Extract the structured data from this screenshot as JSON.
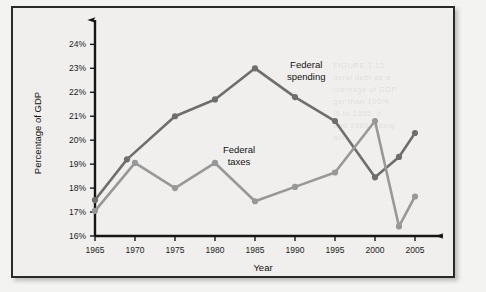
{
  "figure": {
    "background_color": "#f0efed",
    "border_color": "#2a2a2a",
    "page_color": "#f3f3f1"
  },
  "ghost": {
    "line1": "FIGURE 1.12",
    "line2": "deral debt as a",
    "line3": "rcentage of GDP",
    "line4": "ger than 100%",
    "line5": "I5 to 1955, it",
    "line6": "and 1980, rising",
    "line7": "ain."
  },
  "chart_data": {
    "type": "line",
    "title": "",
    "subtitle": "",
    "xlabel": "Year",
    "ylabel": "Percentage of GDP",
    "xlim": [
      1965,
      2007
    ],
    "ylim": [
      16,
      24.6
    ],
    "xticks": [
      1965,
      1970,
      1975,
      1980,
      1985,
      1990,
      1995,
      2000,
      2005
    ],
    "xtick_labels": [
      "1965",
      "1970",
      "1975",
      "1980",
      "1985",
      "1990",
      "1995",
      "2000",
      "2005"
    ],
    "yticks": [
      16,
      17,
      18,
      19,
      20,
      21,
      22,
      23,
      24
    ],
    "ytick_labels": [
      "16%",
      "17%",
      "18%",
      "19%",
      "20%",
      "21%",
      "22%",
      "23%",
      "24%"
    ],
    "grid": false,
    "legend_position": "inline-annotation",
    "axis_style": "arrow-ended",
    "series": [
      {
        "name": "Federal spending",
        "color": "#6e6e6e",
        "marker": "circle",
        "label_x": 1991.4,
        "label_y": 23.0,
        "x": [
          1965,
          1969,
          1975,
          1980,
          1985,
          1990,
          1995,
          2000,
          2003,
          2005
        ],
        "values": [
          17.5,
          19.2,
          21.0,
          21.7,
          23.0,
          21.8,
          20.8,
          18.45,
          19.3,
          20.3
        ]
      },
      {
        "name": "Federal taxes",
        "color": "#989898",
        "marker": "circle",
        "label_x": 1983.0,
        "label_y": 19.45,
        "x": [
          1965,
          1970,
          1975,
          1980,
          1985,
          1990,
          1995,
          2000,
          2003,
          2005
        ],
        "values": [
          17.05,
          19.05,
          18.0,
          19.05,
          17.45,
          18.05,
          18.65,
          20.8,
          16.4,
          17.65
        ]
      }
    ]
  }
}
